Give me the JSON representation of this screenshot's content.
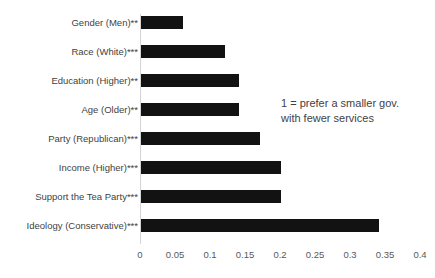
{
  "chart_data": {
    "type": "bar",
    "orientation": "horizontal",
    "title": "",
    "xlabel": "",
    "ylabel": "",
    "xlim": [
      0,
      0.4
    ],
    "xticks": [
      "0",
      "0.05",
      "0.1",
      "0.15",
      "0.2",
      "0.25",
      "0.3",
      "0.35",
      "0.4"
    ],
    "xtick_values": [
      0,
      0.05,
      0.1,
      0.15,
      0.2,
      0.25,
      0.3,
      0.35,
      0.4
    ],
    "grid": false,
    "legend": null,
    "bar_color": "#121212",
    "axis_color": "#d4d4d4",
    "categories": [
      "Gender (Men)**",
      "Race (White)***",
      "Education (Higher)**",
      "Age (Older)**",
      "Party (Republican)***",
      "Income (Higher)***",
      "Support the Tea Party***",
      "Ideology (Conservative)***"
    ],
    "values": [
      0.06,
      0.12,
      0.14,
      0.14,
      0.17,
      0.2,
      0.2,
      0.34
    ],
    "annotations": [
      "1 = prefer a smaller gov.",
      "with fewer services"
    ]
  }
}
